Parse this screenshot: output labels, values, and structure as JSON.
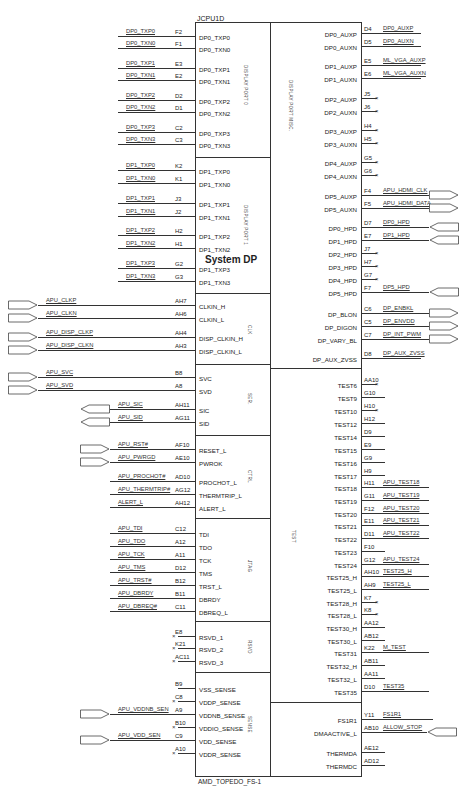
{
  "part": {
    "refdes": "JCPU1D",
    "footprint": "AMD_TOPEDO_FS-1",
    "center_title": "System DP"
  },
  "groups": {
    "dp0": "DISPLAY PORT 0",
    "dp1": "DISPLAY PORT 1",
    "dpmisc": "DISPLAY PORT MISC.",
    "clk": "CLK",
    "ser": "SER.",
    "ctrl": "CTRL",
    "jtag": "JTAG",
    "rsvd": "RSVD",
    "sense": "SENSE",
    "test": "TEST"
  },
  "left_pins": [
    {
      "net": "DP0_TXP0",
      "pin": "F2",
      "name": "DP0_TXP0",
      "y": 36
    },
    {
      "net": "DP0_TXN0",
      "pin": "F1",
      "name": "DP0_TXN0",
      "y": 48
    },
    {
      "net": "DP0_TXP1",
      "pin": "E3",
      "name": "DP0_TXP1",
      "y": 68
    },
    {
      "net": "DP0_TXN1",
      "pin": "E2",
      "name": "DP0_TXN1",
      "y": 80
    },
    {
      "net": "DP0_TXP2",
      "pin": "D2",
      "name": "DP0_TXP2",
      "y": 100
    },
    {
      "net": "DP0_TXN2",
      "pin": "D1",
      "name": "DP0_TXN2",
      "y": 112
    },
    {
      "net": "DP0_TXP3",
      "pin": "C2",
      "name": "DP0_TXP3",
      "y": 132
    },
    {
      "net": "DP0_TXN3",
      "pin": "C3",
      "name": "DP0_TXN3",
      "y": 144
    },
    {
      "net": "DP1_TXP0",
      "pin": "K2",
      "name": "DP1_TXP0",
      "y": 170
    },
    {
      "net": "DP1_TXN0",
      "pin": "K1",
      "name": "DP1_TXN0",
      "y": 183
    },
    {
      "net": "DP1_TXP1",
      "pin": "J3",
      "name": "DP1_TXP1",
      "y": 203
    },
    {
      "net": "DP1_TXN1",
      "pin": "J2",
      "name": "DP1_TXN1",
      "y": 216
    },
    {
      "net": "DP1_TXP2",
      "pin": "H2",
      "name": "DP1_TXP2",
      "y": 235
    },
    {
      "net": "DP1_TXN2",
      "pin": "H1",
      "name": "DP1_TXN2",
      "y": 248
    },
    {
      "net": "DP1_TXP3",
      "pin": "G2",
      "name": "DP1_TXP3",
      "y": 268
    },
    {
      "net": "DP1_TXN3",
      "pin": "G3",
      "name": "DP1_TXN3",
      "y": 281
    }
  ],
  "clk_pins": [
    {
      "net": "APU_CLKP",
      "pin": "AH7",
      "name": "CLKIN_H",
      "y": 305,
      "port": "in"
    },
    {
      "net": "APU_CLKN",
      "pin": "AH6",
      "name": "CLKIN_L",
      "y": 318,
      "port": "in"
    },
    {
      "net": "APU_DISP_CLKP",
      "pin": "AH4",
      "name": "DISP_CLKIN_H",
      "y": 337,
      "port": "in"
    },
    {
      "net": "APU_DISP_CLKN",
      "pin": "AH3",
      "name": "DISP_CLKIN_L",
      "y": 350,
      "port": "in"
    }
  ],
  "ser_pins": [
    {
      "net": "APU_SVC",
      "pin": "B8",
      "name": "SVC",
      "y": 377,
      "port": "in"
    },
    {
      "net": "APU_SVD",
      "pin": "A8",
      "name": "SVD",
      "y": 390,
      "port": "in"
    },
    {
      "net": "APU_SIC",
      "pin": "AH11",
      "name": "SIC",
      "y": 409,
      "port": "out"
    },
    {
      "net": "APU_SID",
      "pin": "AG11",
      "name": "SID",
      "y": 422,
      "port": "out"
    }
  ],
  "ctrl_pins": [
    {
      "net": "APU_RST#",
      "pin": "AF10",
      "name": "RESET_L",
      "y": 449,
      "port": "in"
    },
    {
      "net": "APU_PWRGD",
      "pin": "AE10",
      "name": "PWROK",
      "y": 462,
      "port": "in"
    },
    {
      "net": "APU_PROCHOT#",
      "pin": "AD10",
      "name": "PROCHOT_L",
      "y": 481,
      "port": "none"
    },
    {
      "net": "APU_THERMTRIP#",
      "pin": "AG12",
      "name": "THERMTRIP_L",
      "y": 494,
      "port": "none"
    },
    {
      "net": "ALERT_L",
      "pin": "AH12",
      "name": "ALERT_L",
      "y": 507,
      "port": "none"
    }
  ],
  "jtag_pins": [
    {
      "net": "APU_TDI",
      "pin": "C12",
      "name": "TDI",
      "y": 533
    },
    {
      "net": "APU_TDO",
      "pin": "A12",
      "name": "TDO",
      "y": 546
    },
    {
      "net": "APU_TCK",
      "pin": "A11",
      "name": "TCK",
      "y": 559
    },
    {
      "net": "APU_TMS",
      "pin": "D12",
      "name": "TMS",
      "y": 572
    },
    {
      "net": "APU_TRST#",
      "pin": "B12",
      "name": "TRST_L",
      "y": 585
    },
    {
      "net": "APU_DBRDY",
      "pin": "B11",
      "name": "DBRDY",
      "y": 598
    },
    {
      "net": "APU_DBREQ#",
      "pin": "C11",
      "name": "DBREQ_L",
      "y": 611
    }
  ],
  "rsvd_pins": [
    {
      "pin": "E8",
      "name": "RSVD_1",
      "y": 636,
      "nc": true
    },
    {
      "pin": "K21",
      "name": "RSVD_2",
      "y": 648,
      "nc": true
    },
    {
      "pin": "AC11",
      "name": "RSVD_3",
      "y": 661,
      "nc": true
    }
  ],
  "sense_pins": [
    {
      "net": "",
      "pin": "B9",
      "name": "VSS_SENSE",
      "y": 688,
      "nc": false,
      "port": "none"
    },
    {
      "net": "",
      "pin": "C8",
      "name": "VDDP_SENSE",
      "y": 701,
      "nc": true,
      "port": "none"
    },
    {
      "net": "APU_VDDNB_SEN",
      "pin": "A9",
      "name": "VDDNB_SENSE",
      "y": 714,
      "nc": false,
      "port": "in"
    },
    {
      "net": "",
      "pin": "B10",
      "name": "VDDIO_SENSE",
      "y": 727,
      "nc": true,
      "port": "none"
    },
    {
      "net": "APU_VDD_SEN",
      "pin": "C9",
      "name": "VDD_SENSE",
      "y": 740,
      "nc": false,
      "port": "in"
    },
    {
      "net": "",
      "pin": "A10",
      "name": "VDDR_SENSE",
      "y": 753,
      "nc": true,
      "port": "none"
    }
  ],
  "right_dp": [
    {
      "name": "DP0_AUXP",
      "pin": "D4",
      "net": "DP0_AUXP",
      "y": 33,
      "nc": false,
      "port": "none"
    },
    {
      "name": "DP0_AUXN",
      "pin": "D5",
      "net": "DP0_AUXN",
      "y": 46,
      "nc": false,
      "port": "none"
    },
    {
      "name": "DP1_AUXP",
      "pin": "E5",
      "net": "ML_VGA_AUXP",
      "y": 65,
      "nc": false,
      "port": "none"
    },
    {
      "name": "DP1_AUXN",
      "pin": "E6",
      "net": "ML_VGA_AUXN",
      "y": 78,
      "nc": false,
      "port": "none"
    },
    {
      "name": "DP2_AUXP",
      "pin": "J5",
      "net": "",
      "y": 98,
      "nc": true,
      "port": "none"
    },
    {
      "name": "DP2_AUXN",
      "pin": "J6",
      "net": "",
      "y": 111,
      "nc": true,
      "port": "none"
    },
    {
      "name": "DP3_AUXP",
      "pin": "H4",
      "net": "",
      "y": 130,
      "nc": true,
      "port": "none"
    },
    {
      "name": "DP3_AUXN",
      "pin": "H5",
      "net": "",
      "y": 143,
      "nc": true,
      "port": "none"
    },
    {
      "name": "DP4_AUXP",
      "pin": "G5",
      "net": "",
      "y": 162,
      "nc": true,
      "port": "none"
    },
    {
      "name": "DP4_AUXN",
      "pin": "G6",
      "net": "",
      "y": 175,
      "nc": true,
      "port": "none"
    },
    {
      "name": "DP5_AUXP",
      "pin": "F4",
      "net": "APU_HDMI_CLK",
      "y": 195,
      "nc": false,
      "port": "out"
    },
    {
      "name": "DP5_AUXN",
      "pin": "F5",
      "net": "APU_HDMI_DATA",
      "y": 208,
      "nc": false,
      "port": "out"
    },
    {
      "name": "DP0_HPD",
      "pin": "D7",
      "net": "DP0_HPD",
      "y": 227,
      "nc": false,
      "port": "in"
    },
    {
      "name": "DP1_HPD",
      "pin": "E7",
      "net": "DP1_HPD",
      "y": 240,
      "nc": false,
      "port": "in"
    },
    {
      "name": "DP2_HPD",
      "pin": "J7",
      "net": "",
      "y": 253,
      "nc": true,
      "port": "none"
    },
    {
      "name": "DP3_HPD",
      "pin": "H7",
      "net": "",
      "y": 266,
      "nc": true,
      "port": "none"
    },
    {
      "name": "DP4_HPD",
      "pin": "G7",
      "net": "",
      "y": 279,
      "nc": true,
      "port": "none"
    },
    {
      "name": "DP5_HPD",
      "pin": "F7",
      "net": "DP5_HPD",
      "y": 292,
      "nc": false,
      "port": "in"
    },
    {
      "name": "DP_BLON",
      "pin": "C6",
      "net": "DP_ENBKL",
      "y": 313,
      "nc": false,
      "port": "out"
    },
    {
      "name": "DP_DIGON",
      "pin": "C5",
      "net": "DP_ENVDD",
      "y": 326,
      "nc": false,
      "port": "out"
    },
    {
      "name": "DP_VARY_BL",
      "pin": "C7",
      "net": "DP_INT_PWM",
      "y": 339,
      "nc": false,
      "port": "out"
    },
    {
      "name": "DP_AUX_ZVSS",
      "pin": "D8",
      "net": "DP_AUX_ZVSS",
      "y": 358,
      "nc": false,
      "port": "none"
    }
  ],
  "right_test": [
    {
      "name": "TEST6",
      "pin": "AA10",
      "net": "",
      "y": 384,
      "nc": true
    },
    {
      "name": "TEST9",
      "pin": "G10",
      "net": "",
      "y": 397,
      "nc": false
    },
    {
      "name": "TEST10",
      "pin": "H10",
      "net": "",
      "y": 410,
      "nc": true
    },
    {
      "name": "TEST12",
      "pin": "H12",
      "net": "",
      "y": 423,
      "nc": false
    },
    {
      "name": "TEST14",
      "pin": "D9",
      "net": "",
      "y": 436,
      "nc": false
    },
    {
      "name": "TEST15",
      "pin": "E9",
      "net": "",
      "y": 449,
      "nc": false
    },
    {
      "name": "TEST16",
      "pin": "G9",
      "net": "",
      "y": 462,
      "nc": false
    },
    {
      "name": "TEST17",
      "pin": "H9",
      "net": "",
      "y": 475,
      "nc": false
    },
    {
      "name": "TEST18",
      "pin": "H11",
      "net": "APU_TEST18",
      "y": 487,
      "nc": false
    },
    {
      "name": "TEST19",
      "pin": "G11",
      "net": "APU_TEST19",
      "y": 500,
      "nc": false
    },
    {
      "name": "TEST20",
      "pin": "F12",
      "net": "APU_TEST20",
      "y": 513,
      "nc": false
    },
    {
      "name": "TEST21",
      "pin": "E11",
      "net": "APU_TEST21",
      "y": 525,
      "nc": false
    },
    {
      "name": "TEST22",
      "pin": "D11",
      "net": "APU_TEST22",
      "y": 538,
      "nc": false
    },
    {
      "name": "TEST23",
      "pin": "F10",
      "net": "",
      "y": 551,
      "nc": false
    },
    {
      "name": "TEST24",
      "pin": "G12",
      "net": "APU_TEST24",
      "y": 564,
      "nc": false
    },
    {
      "name": "TEST25_H",
      "pin": "AH10",
      "net": "TEST25_H",
      "y": 576,
      "nc": false
    },
    {
      "name": "TEST25_L",
      "pin": "AH9",
      "net": "TEST25_L",
      "y": 589,
      "nc": false
    },
    {
      "name": "TEST28_H",
      "pin": "K7",
      "net": "",
      "y": 602,
      "nc": true
    },
    {
      "name": "TEST28_L",
      "pin": "K8",
      "net": "",
      "y": 614,
      "nc": true
    },
    {
      "name": "TEST30_H",
      "pin": "AA12",
      "net": "",
      "y": 627,
      "nc": false
    },
    {
      "name": "TEST30_L",
      "pin": "AB12",
      "net": "",
      "y": 640,
      "nc": false
    },
    {
      "name": "TEST31",
      "pin": "K22",
      "net": "M_TEST",
      "y": 652,
      "nc": false
    },
    {
      "name": "TEST32_H",
      "pin": "AB11",
      "net": "",
      "y": 665,
      "nc": false
    },
    {
      "name": "TEST32_L",
      "pin": "AA11",
      "net": "",
      "y": 678,
      "nc": false
    },
    {
      "name": "TEST35",
      "pin": "D10",
      "net": "TEST35",
      "y": 691,
      "nc": false
    }
  ],
  "right_misc": [
    {
      "name": "FS1R1",
      "pin": "Y11",
      "net": "FS1R1",
      "y": 719,
      "port": "none"
    },
    {
      "name": "DMAACTIVE_L",
      "pin": "AB10",
      "net": "ALLOW_STOP",
      "y": 732,
      "port": "in"
    },
    {
      "name": "THERMDA",
      "pin": "AE12",
      "net": "",
      "y": 752,
      "port": "none"
    },
    {
      "name": "THERMDC",
      "pin": "AD12",
      "net": "",
      "y": 765,
      "port": "none"
    }
  ]
}
